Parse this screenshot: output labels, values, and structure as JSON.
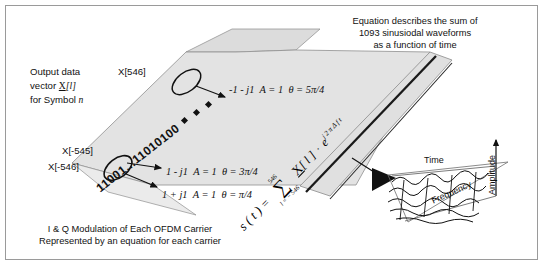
{
  "figure": {
    "title_hidden": "",
    "border_color": "#9a9a9a",
    "slab_fill": "#e3e3e3",
    "slab_stroke": "#7d7d7d"
  },
  "annotations": {
    "output_vector": {
      "line1": "Output data",
      "line2_prefix": "vector ",
      "line2_symbol": "X",
      "line2_index": "[l]",
      "line3_prefix": "for Symbol ",
      "line3_symbol": "n"
    },
    "top_right_note": {
      "line1": "Equation describes the sum of",
      "line2": "1093 sinusiodal waveforms",
      "line3": "as a function of time"
    },
    "bottom_caption": {
      "line1": "I & Q Modulation of Each OFDM Carrier",
      "line2": "Represented by an equation for each carrier"
    }
  },
  "subcarrier_labels": {
    "top": "X[546]",
    "mid": "X[-545]",
    "bottom": "X[-546]"
  },
  "bitstream": {
    "text": "11001...11010100",
    "highlight_head": "11001",
    "highlight_tail": "11010100"
  },
  "constellation": [
    {
      "value": "-1 - j1",
      "amplitude": "A = 1",
      "phase": "θ = 5π/4"
    },
    {
      "value": "1 - j1",
      "amplitude": "A = 1",
      "phase": "θ = 3π/4"
    },
    {
      "value": "1 + j1",
      "amplitude": "A = 1",
      "phase": "θ = π/4"
    }
  ],
  "equation": {
    "lhs": "s ( t )",
    "equals": "=",
    "sum_symbol": "∑",
    "sum_upper": "546",
    "sum_lower": "l = − 546",
    "term_symbol": "X",
    "term_index": "[ l ]",
    "multiply": "·",
    "exp_base": "e",
    "exp_power": "j 2 π Δ f t"
  },
  "plot3d": {
    "axis_time": "Time",
    "axis_frequency": "Frequency",
    "axis_amplitude": "Amplitude",
    "type": "waveform-surface"
  },
  "ellipsis_marker": {
    "name": "diamond-ellipsis",
    "count": 3
  }
}
